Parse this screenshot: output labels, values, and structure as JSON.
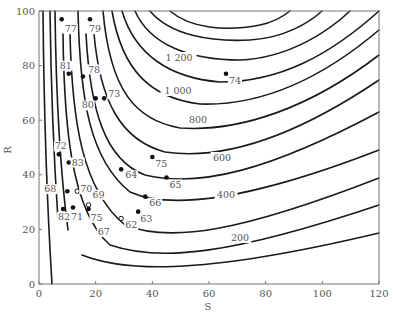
{
  "chart_data": {
    "type": "contour",
    "title": "",
    "xlabel": "S",
    "ylabel": "R",
    "xlim": [
      0,
      120
    ],
    "ylim": [
      0,
      100
    ],
    "x_ticks": [
      0,
      20,
      40,
      60,
      80,
      100,
      120
    ],
    "y_ticks": [
      0,
      20,
      40,
      60,
      80,
      100
    ],
    "grid": false,
    "contour_levels_labeled": [
      200,
      400,
      600,
      800,
      1000,
      1200
    ],
    "contour_label_text": [
      "200",
      "400",
      "600",
      "800",
      "1 000",
      "1 200"
    ],
    "points": [
      {
        "label": "77",
        "S": 8,
        "R": 97,
        "marker": "filled"
      },
      {
        "label": "79",
        "S": 18,
        "R": 97,
        "marker": "filled"
      },
      {
        "label": "81",
        "S": 10.5,
        "R": 77,
        "marker": "filled"
      },
      {
        "label": "78",
        "S": 15.5,
        "R": 76,
        "marker": "filled"
      },
      {
        "label": "80",
        "S": 20,
        "R": 68,
        "marker": "filled"
      },
      {
        "label": "73",
        "S": 23,
        "R": 68,
        "marker": "filled"
      },
      {
        "label": "74",
        "S": 66,
        "R": 77,
        "marker": "filled"
      },
      {
        "label": "72",
        "S": 7,
        "R": 47.5,
        "marker": "filled"
      },
      {
        "label": "83",
        "S": 10.5,
        "R": 44.5,
        "marker": "filled"
      },
      {
        "label": "68",
        "S": 10,
        "R": 34,
        "marker": "filled"
      },
      {
        "label": "70",
        "S": 13.5,
        "R": 34,
        "marker": "open"
      },
      {
        "label": "69",
        "S": 17.5,
        "R": 29,
        "marker": "open"
      },
      {
        "label": "82",
        "S": 8.5,
        "R": 27.5,
        "marker": "filled"
      },
      {
        "label": "71",
        "S": 12,
        "R": 28,
        "marker": "filled"
      },
      {
        "label": "75",
        "S": 17.5,
        "R": 27.5,
        "marker": "filled"
      },
      {
        "label": "75",
        "S": 40,
        "R": 46.5,
        "marker": "filled"
      },
      {
        "label": "64",
        "S": 29,
        "R": 42,
        "marker": "filled"
      },
      {
        "label": "65",
        "S": 45,
        "R": 39,
        "marker": "filled"
      },
      {
        "label": "66",
        "S": 37.5,
        "R": 32,
        "marker": "filled"
      },
      {
        "label": "63",
        "S": 35,
        "R": 26.5,
        "marker": "filled"
      },
      {
        "label": "62",
        "S": 29,
        "R": 24,
        "marker": "open"
      },
      {
        "label": "67",
        "S": 25,
        "R": 22,
        "marker": "none"
      }
    ]
  },
  "axes": {
    "x_tick_labels": [
      "0",
      "20",
      "40",
      "60",
      "80",
      "100",
      "120"
    ],
    "y_tick_labels": [
      "0",
      "20",
      "40",
      "60",
      "80",
      "100"
    ],
    "x_title": "S",
    "y_title": "R"
  }
}
